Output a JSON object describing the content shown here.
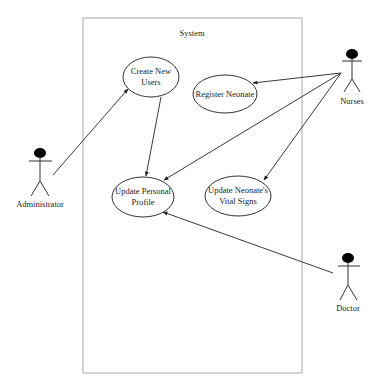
{
  "diagram": {
    "type": "use-case",
    "system": {
      "label": "System"
    },
    "actors": [
      {
        "id": "administrator",
        "label": "Administrator"
      },
      {
        "id": "nurses",
        "label": "Nurses"
      },
      {
        "id": "doctor",
        "label": "Doctor"
      }
    ],
    "use_cases": [
      {
        "id": "create-new-users",
        "lines": [
          "Create New",
          "Users"
        ]
      },
      {
        "id": "register-neonate",
        "lines": [
          "Register Neonate"
        ]
      },
      {
        "id": "update-personal-profile",
        "lines": [
          "Update Personal",
          "Profile"
        ]
      },
      {
        "id": "update-neonate-vital-signs",
        "lines": [
          "Update Neonate's",
          "Vital Signs"
        ]
      }
    ],
    "associations": [
      {
        "from": "administrator",
        "to": "create-new-users"
      },
      {
        "from": "create-new-users",
        "to": "update-personal-profile"
      },
      {
        "from": "nurses",
        "to": "register-neonate"
      },
      {
        "from": "nurses",
        "to": "update-personal-profile"
      },
      {
        "from": "nurses",
        "to": "update-neonate-vital-signs"
      },
      {
        "from": "doctor",
        "to": "update-personal-profile"
      }
    ],
    "colors": {
      "line": "#3a3a3a",
      "boundary": "#a9a9a9",
      "actor_head": "#000000"
    }
  }
}
